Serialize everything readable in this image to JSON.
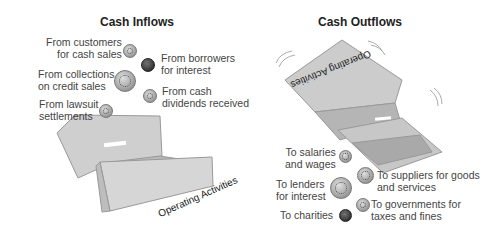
{
  "inflows": {
    "title": "Cash Inflows",
    "items": [
      {
        "line1": "From customers",
        "line2": "for cash sales"
      },
      {
        "line1": "From borrowers",
        "line2": "for interest"
      },
      {
        "line1": "From collections",
        "line2": "on credit sales"
      },
      {
        "line1": "From cash",
        "line2": "dividends received"
      },
      {
        "line1": "From lawsuit",
        "line2": "settlements"
      }
    ],
    "box_label": "Operating Activities"
  },
  "outflows": {
    "title": "Cash Outflows",
    "items": [
      {
        "line1": "To salaries",
        "line2": "and wages"
      },
      {
        "line1": "To suppliers for goods",
        "line2": "and services"
      },
      {
        "line1": "To lenders",
        "line2": "for interest"
      },
      {
        "line1": "To governments for",
        "line2": "taxes and fines"
      },
      {
        "line1": "To charities",
        "line2": ""
      }
    ],
    "box_label": "Operating Activities"
  }
}
